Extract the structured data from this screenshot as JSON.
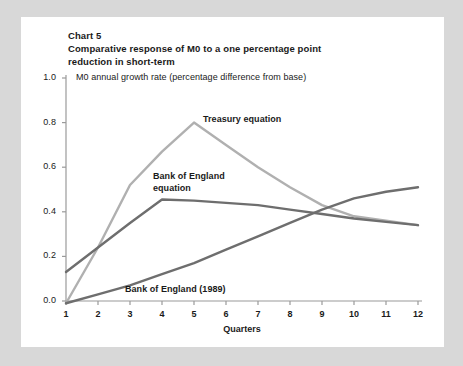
{
  "card": {
    "background": "#ffffff",
    "page_background": "#d8d8d8"
  },
  "title": {
    "line1": "Chart 5",
    "line2": "Comparative response of M0 to a one percentage point",
    "line3": "reduction in short-term"
  },
  "chart_data": {
    "type": "line",
    "title": "Comparative response of M0 to a one percentage point reduction in short-term",
    "subtitle": "M0 annual growth rate (percentage difference from base)",
    "xlabel": "Quarters",
    "ylabel": "",
    "xlim": [
      1,
      12
    ],
    "ylim": [
      0.0,
      1.0
    ],
    "grid": false,
    "legend_position": "inline-annotations",
    "x": [
      1,
      2,
      3,
      4,
      5,
      6,
      7,
      8,
      9,
      10,
      11,
      12
    ],
    "xticklabels": [
      "1",
      "2",
      "3",
      "4",
      "5",
      "6",
      "7",
      "8",
      "9",
      "10",
      "11",
      "12"
    ],
    "yticks": [
      0.0,
      0.2,
      0.4,
      0.6,
      0.8,
      1.0
    ],
    "yticklabels": [
      "0.0",
      "0.2",
      "0.4",
      "0.6",
      "0.8",
      "1.0"
    ],
    "series": [
      {
        "name": "Treasury equation",
        "color": "#b0b0b0",
        "values": [
          -0.01,
          0.24,
          0.52,
          0.67,
          0.8,
          0.7,
          0.6,
          0.51,
          0.43,
          0.38,
          0.36,
          0.34
        ]
      },
      {
        "name": "Bank of England equation",
        "color": "#6e6e6e",
        "values": [
          0.13,
          0.24,
          0.35,
          0.455,
          0.45,
          0.44,
          0.43,
          0.41,
          0.39,
          0.37,
          0.355,
          0.34
        ]
      },
      {
        "name": "Bank of England (1989)",
        "color": "#6e6e6e",
        "values": [
          -0.01,
          0.03,
          0.07,
          0.12,
          0.17,
          0.23,
          0.29,
          0.35,
          0.41,
          0.46,
          0.49,
          0.51
        ]
      }
    ]
  },
  "annotations": [
    {
      "id": "treasury",
      "text": "Treasury equation"
    },
    {
      "id": "boe-equation-l1",
      "text": "Bank of England"
    },
    {
      "id": "boe-equation-l2",
      "text": "equation"
    },
    {
      "id": "boe-1989",
      "text": "Bank of England (1989)"
    }
  ],
  "axis": {
    "color": "#9a9a9a",
    "x_title": "Quarters"
  }
}
